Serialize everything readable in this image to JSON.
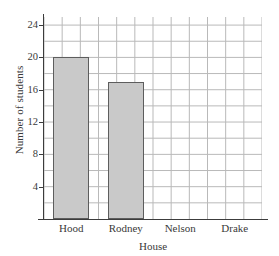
{
  "chart_data": {
    "type": "bar",
    "title": "",
    "categories": [
      "Hood",
      "Rodney",
      "Nelson",
      "Drake"
    ],
    "values": [
      20,
      17,
      0,
      0
    ],
    "xlabel": "House",
    "ylabel": "Number of students",
    "ylim": [
      0,
      25
    ],
    "y_tick_labels": [
      "4",
      "8",
      "12",
      "16",
      "20",
      "24"
    ],
    "y_tick_values": [
      4,
      8,
      12,
      16,
      20,
      24
    ],
    "y_minor_step": 2,
    "grid": true,
    "legend": "none",
    "bar_fill_color": "#c9c9c9",
    "bar_border_color": "#5d5d5d",
    "grid_color": "#b9b9b9",
    "axis_color": "#3c3c3c"
  }
}
